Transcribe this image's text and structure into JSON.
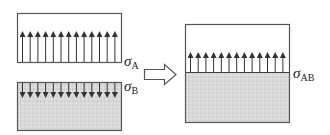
{
  "diagram": {
    "title": "",
    "colors": {
      "outline": "#555555",
      "arrow": "#333333",
      "fill_material": "#d6d6d6",
      "fill_empty": "#ffffff"
    },
    "panels": [
      {
        "id": "A",
        "description": "Surface A with upward stress arrows",
        "label_symbol": "σ",
        "label_subscript": "A",
        "arrow_count": 13,
        "arrow_direction": "up",
        "fill": "empty"
      },
      {
        "id": "B",
        "description": "Surface B with downward stress arrows",
        "label_symbol": "σ",
        "label_subscript": "B",
        "arrow_count": 13,
        "arrow_direction": "down",
        "fill": "material"
      },
      {
        "id": "AB",
        "description": "Combined interface AB with upward stress arrows",
        "label_symbol": "σ",
        "label_subscript": "AB",
        "arrow_count": 13,
        "arrow_direction": "up",
        "fill": "upper empty, lower material"
      }
    ],
    "transition_arrow": "hollow-right-arrow"
  }
}
